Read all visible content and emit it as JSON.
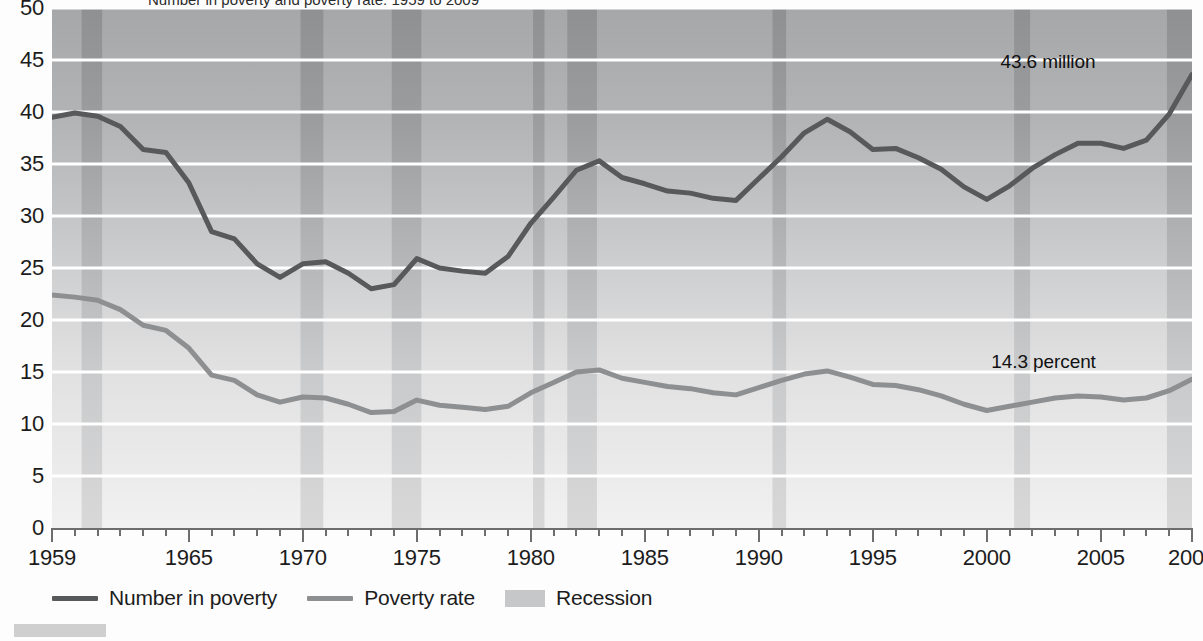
{
  "title": "Number in poverty and poverty rate: 1959 to 2009",
  "annotations": {
    "number_label": "43.6 million",
    "rate_label": "14.3 percent"
  },
  "legend": {
    "items": [
      {
        "label": "Number in poverty",
        "type": "line",
        "color": "#58595b"
      },
      {
        "label": "Poverty rate",
        "type": "line",
        "color": "#8d8f91"
      },
      {
        "label": "Recession",
        "type": "band",
        "color": "#c6c7c8"
      }
    ]
  },
  "axes": {
    "y": {
      "ticks": [
        "0",
        "5",
        "10",
        "15",
        "20",
        "25",
        "30",
        "35",
        "40",
        "45",
        "50"
      ],
      "min": 0,
      "max": 50
    },
    "x": {
      "labels": [
        "1959",
        "1965",
        "1970",
        "1975",
        "1980",
        "1985",
        "1990",
        "1995",
        "2000",
        "2005",
        "2009"
      ],
      "min": 1959,
      "max": 2009
    }
  },
  "colors": {
    "number_line": "#58595b",
    "rate_line": "#8d8f91",
    "recession_band": "#c4c5c6",
    "gridline": "#ffffff",
    "plot_background_top": "#a8a9ab",
    "plot_background_bottom": "#efefef",
    "axis": "#6d6d6d"
  },
  "chart_data": {
    "type": "line",
    "title": "Number in poverty and poverty rate: 1959 to 2009",
    "xlabel": "",
    "ylabel": "",
    "xlim": [
      1959,
      2009
    ],
    "ylim": [
      0,
      50
    ],
    "grid": true,
    "legend_position": "bottom-left",
    "x": [
      1959,
      1960,
      1961,
      1962,
      1963,
      1964,
      1965,
      1966,
      1967,
      1968,
      1969,
      1970,
      1971,
      1972,
      1973,
      1974,
      1975,
      1976,
      1977,
      1978,
      1979,
      1980,
      1981,
      1982,
      1983,
      1984,
      1985,
      1986,
      1987,
      1988,
      1989,
      1990,
      1991,
      1992,
      1993,
      1994,
      1995,
      1996,
      1997,
      1998,
      1999,
      2000,
      2001,
      2002,
      2003,
      2004,
      2005,
      2006,
      2007,
      2008,
      2009
    ],
    "series": [
      {
        "name": "Number in poverty",
        "units": "millions",
        "color": "#58595b",
        "values": [
          39.5,
          39.9,
          39.6,
          38.6,
          36.4,
          36.1,
          33.2,
          28.5,
          27.8,
          25.4,
          24.1,
          25.4,
          25.6,
          24.5,
          23.0,
          23.4,
          25.9,
          25.0,
          24.7,
          24.5,
          26.1,
          29.3,
          31.8,
          34.4,
          35.3,
          33.7,
          33.1,
          32.4,
          32.2,
          31.7,
          31.5,
          33.6,
          35.7,
          38.0,
          39.3,
          38.1,
          36.4,
          36.5,
          35.6,
          34.5,
          32.8,
          31.6,
          32.9,
          34.6,
          35.9,
          37.0,
          37.0,
          36.5,
          37.3,
          39.8,
          43.6
        ]
      },
      {
        "name": "Poverty rate",
        "units": "percent",
        "color": "#8d8f91",
        "values": [
          22.4,
          22.2,
          21.9,
          21.0,
          19.5,
          19.0,
          17.3,
          14.7,
          14.2,
          12.8,
          12.1,
          12.6,
          12.5,
          11.9,
          11.1,
          11.2,
          12.3,
          11.8,
          11.6,
          11.4,
          11.7,
          13.0,
          14.0,
          15.0,
          15.2,
          14.4,
          14.0,
          13.6,
          13.4,
          13.0,
          12.8,
          13.5,
          14.2,
          14.8,
          15.1,
          14.5,
          13.8,
          13.7,
          13.3,
          12.7,
          11.9,
          11.3,
          11.7,
          12.1,
          12.5,
          12.7,
          12.6,
          12.3,
          12.5,
          13.2,
          14.3
        ]
      }
    ],
    "bands": [
      {
        "name": "Recession",
        "start": 1960.3,
        "end": 1961.2
      },
      {
        "name": "Recession",
        "start": 1969.9,
        "end": 1970.9
      },
      {
        "name": "Recession",
        "start": 1973.9,
        "end": 1975.2
      },
      {
        "name": "Recession",
        "start": 1980.1,
        "end": 1980.6
      },
      {
        "name": "Recession",
        "start": 1981.6,
        "end": 1982.9
      },
      {
        "name": "Recession",
        "start": 1990.6,
        "end": 1991.2
      },
      {
        "name": "Recession",
        "start": 2001.2,
        "end": 2001.9
      },
      {
        "name": "Recession",
        "start": 2007.9,
        "end": 2009.5
      }
    ]
  }
}
